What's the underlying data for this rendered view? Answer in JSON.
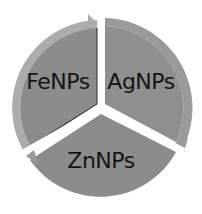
{
  "diagram": {
    "type": "cycle",
    "segments": [
      {
        "label": "FeNPs",
        "position": "upper-left"
      },
      {
        "label": "AgNPs",
        "position": "upper-right"
      },
      {
        "label": "ZnNPs",
        "position": "bottom"
      }
    ],
    "colors": {
      "segment_fill": "#8c8c8c",
      "ring_fill": "#a9a9a9",
      "separator": "#ffffff",
      "text": "#151515"
    }
  }
}
